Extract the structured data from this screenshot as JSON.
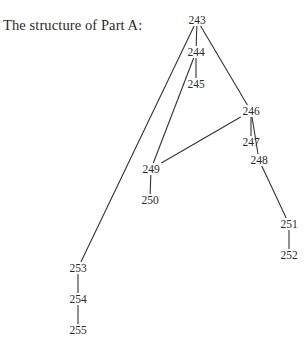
{
  "title": "The structure of Part A:",
  "colors": {
    "line": "#333333",
    "text": "#2a2a2a",
    "background": "#ffffff"
  },
  "nodes": [
    {
      "id": "243",
      "label": "243",
      "x": 197,
      "y": 20
    },
    {
      "id": "244",
      "label": "244",
      "x": 196,
      "y": 52
    },
    {
      "id": "245",
      "label": "245",
      "x": 196,
      "y": 84
    },
    {
      "id": "246",
      "label": "246",
      "x": 251,
      "y": 111
    },
    {
      "id": "247",
      "label": "247",
      "x": 251,
      "y": 142
    },
    {
      "id": "248",
      "label": "248",
      "x": 259,
      "y": 160
    },
    {
      "id": "249",
      "label": "249",
      "x": 151,
      "y": 169
    },
    {
      "id": "250",
      "label": "250",
      "x": 150,
      "y": 200
    },
    {
      "id": "251",
      "label": "251",
      "x": 289,
      "y": 224
    },
    {
      "id": "252",
      "label": "252",
      "x": 289,
      "y": 255
    },
    {
      "id": "253",
      "label": "253",
      "x": 78,
      "y": 268
    },
    {
      "id": "254",
      "label": "254",
      "x": 78,
      "y": 299
    },
    {
      "id": "255",
      "label": "255",
      "x": 78,
      "y": 330
    }
  ],
  "edges": [
    {
      "from": "243",
      "to": "244"
    },
    {
      "from": "244",
      "to": "245"
    },
    {
      "from": "243",
      "to": "246"
    },
    {
      "from": "243",
      "to": "253"
    },
    {
      "from": "244",
      "to": "249"
    },
    {
      "from": "246",
      "to": "247"
    },
    {
      "from": "246",
      "to": "248"
    },
    {
      "from": "246",
      "to": "249"
    },
    {
      "from": "249",
      "to": "250"
    },
    {
      "from": "248",
      "to": "251"
    },
    {
      "from": "251",
      "to": "252"
    },
    {
      "from": "253",
      "to": "254"
    },
    {
      "from": "254",
      "to": "255"
    }
  ]
}
